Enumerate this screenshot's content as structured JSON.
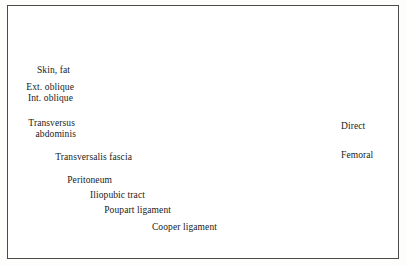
{
  "figure": {
    "style": "pen-and-ink medical illustration",
    "border_color": "#4a4a4a",
    "background_color": "#ffffff",
    "ink_color": "#1a1a1a"
  },
  "labels": {
    "skin_fat": "Skin, fat",
    "ext_oblique": "Ext. oblique",
    "int_oblique": "Int. oblique",
    "transversus": "Transversus",
    "abdominis": "abdominis",
    "transversalis_fascia": "Transversalis fascia",
    "peritoneum": "Peritoneum",
    "iliopubic_tract": "Iliopubic tract",
    "poupart_ligament": "Poupart ligament",
    "cooper_ligament": "Cooper ligament",
    "direct": "Direct",
    "femoral": "Femoral"
  },
  "structures": {
    "vessels": "femoral artery and vein cross-sections",
    "bone": "stippled pubic bone cross-section",
    "defects": [
      "direct hernia defect",
      "femoral hernia defect"
    ]
  }
}
